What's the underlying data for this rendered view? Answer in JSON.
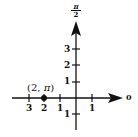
{
  "diagram": {
    "type": "polar-coordinate-plot",
    "axis_labels": {
      "polar_axis": "0",
      "vertical_axis_numerator": "π",
      "vertical_axis_denominator": "2"
    },
    "horizontal_ticks": [
      {
        "label": "3",
        "position": -3
      },
      {
        "label": "2",
        "position": -2
      },
      {
        "label": "1",
        "position": -1
      },
      {
        "label": "1",
        "position": 1
      }
    ],
    "vertical_ticks": [
      {
        "label": "3",
        "position": 3
      },
      {
        "label": "2",
        "position": 2
      },
      {
        "label": "1",
        "position": 1
      },
      {
        "label": "1",
        "position": -1
      }
    ],
    "point": {
      "label_open": "(2,",
      "label_theta": "π",
      "label_close": ")",
      "r": 2,
      "theta": "π"
    },
    "colors": {
      "ink": "#111111",
      "background": "#ffffff"
    }
  }
}
